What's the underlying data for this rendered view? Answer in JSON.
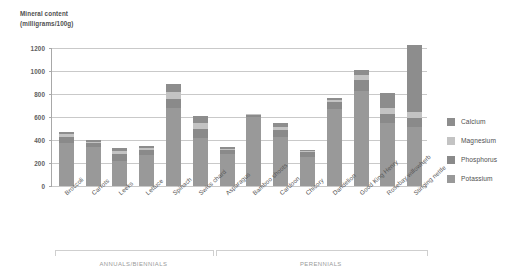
{
  "axis_title": "Mineral content\n(milligrams/100g)",
  "legend": {
    "position": "right",
    "items": [
      {
        "label": "Calcium",
        "color": "#8d8d8d"
      },
      {
        "label": "Magnesium",
        "color": "#c3c3c3"
      },
      {
        "label": "Phosphorus",
        "color": "#8a8a8a"
      },
      {
        "label": "Potassium",
        "color": "#999999"
      }
    ]
  },
  "groups": [
    {
      "label": "ANNUALS/BIENNIALS",
      "start": 0,
      "end": 5
    },
    {
      "label": "PERENNIALS",
      "start": 6,
      "end": 13
    }
  ],
  "chart_data": {
    "type": "bar",
    "stacked": true,
    "title": "",
    "subtitle": "",
    "xlabel": "",
    "ylabel": "Mineral content (milligrams/100g)",
    "ylim": [
      0,
      1200
    ],
    "yticks": [
      0,
      200,
      400,
      600,
      800,
      1000,
      1200
    ],
    "grid": true,
    "categories": [
      "Broccoli",
      "Carrots",
      "Leeks",
      "Lettuce",
      "Spinach",
      "Swiss chard",
      "Asparagus",
      "Bamboo shoots",
      "Cardoon",
      "Chicory",
      "Dandelion",
      "Good King Henry",
      "Rosebay willowherb",
      "Stinging nettle"
    ],
    "series": [
      {
        "name": "Potassium",
        "color": "#999999",
        "values": [
          370,
          340,
          220,
          270,
          680,
          415,
          280,
          600,
          430,
          250,
          670,
          830,
          550,
          515
        ]
      },
      {
        "name": "Phosphorus",
        "color": "#8a8a8a",
        "values": [
          60,
          35,
          60,
          45,
          80,
          80,
          35,
          20,
          60,
          45,
          60,
          90,
          75,
          75
        ]
      },
      {
        "name": "Magnesium",
        "color": "#c3c3c3",
        "values": [
          20,
          10,
          25,
          15,
          60,
          55,
          10,
          5,
          25,
          10,
          15,
          45,
          55,
          55
        ]
      },
      {
        "name": "Calcium",
        "color": "#8d8d8d",
        "values": [
          20,
          15,
          30,
          15,
          65,
          55,
          15,
          5,
          30,
          10,
          20,
          40,
          125,
          585
        ]
      }
    ],
    "totals": [
      470,
      400,
      335,
      345,
      885,
      605,
      340,
      630,
      545,
      315,
      765,
      1005,
      805,
      1230
    ]
  }
}
